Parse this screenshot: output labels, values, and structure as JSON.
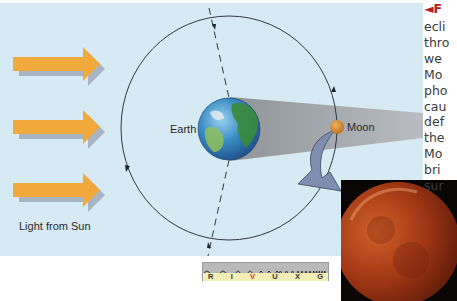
{
  "diagram": {
    "labels": {
      "earth": "Earth",
      "moon": "Moon",
      "sun_light": "Light from Sun"
    },
    "sunlight_arrows": 3,
    "colors": {
      "panel_background": "#d6eaf3",
      "sunlight_arrow": "#f0a93a",
      "arrow_shadow": "#a8b4c4",
      "shadow_cone": "#a3a8ad",
      "moon": "#d4882e",
      "curved_arrow": "#7f8db0",
      "eclipse_moon": "#a63a12"
    }
  },
  "spectrum": {
    "bands": [
      {
        "letter": "R",
        "active": false
      },
      {
        "letter": "I",
        "active": false
      },
      {
        "letter": "V",
        "active": true
      },
      {
        "letter": "U",
        "active": false
      },
      {
        "letter": "X",
        "active": false
      },
      {
        "letter": "G",
        "active": false
      }
    ]
  },
  "caption": {
    "lines": [
      "◄F",
      "ecli",
      "thro",
      "we",
      "Mo",
      "pho",
      "cau",
      "def",
      "the",
      "Mo",
      "bri",
      "sur"
    ]
  },
  "photo": {
    "subject": "lunar-eclipse-red-moon"
  }
}
